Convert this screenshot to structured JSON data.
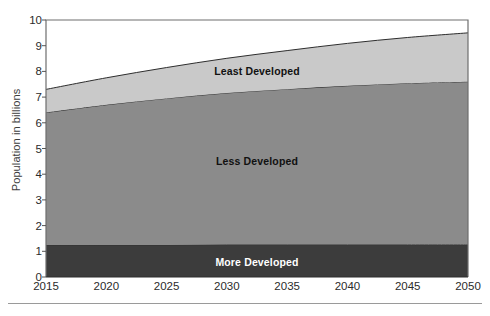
{
  "chart_data": {
    "type": "area",
    "stacked": true,
    "title": "",
    "subtitle": "",
    "xlabel": "",
    "ylabel": "Population in billions",
    "xlim": [
      2015,
      2050
    ],
    "ylim": [
      0,
      10
    ],
    "grid": false,
    "legend_position": "inline-annotations",
    "x": [
      2015,
      2020,
      2025,
      2030,
      2035,
      2040,
      2045,
      2050
    ],
    "xticklabels": [
      "2015",
      "2020",
      "2025",
      "2030",
      "2035",
      "2040",
      "2045",
      "2050"
    ],
    "yticks": [
      0,
      1,
      2,
      3,
      4,
      5,
      6,
      7,
      8,
      9,
      10
    ],
    "yticklabels": [
      "0",
      "1",
      "2",
      "3",
      "4",
      "5",
      "6",
      "7",
      "8",
      "9",
      "10"
    ],
    "series": [
      {
        "name": "More Developed",
        "color": "#3c3c3c",
        "label_color": "#ffffff",
        "values": [
          1.25,
          1.25,
          1.25,
          1.26,
          1.26,
          1.26,
          1.26,
          1.26
        ]
      },
      {
        "name": "Less Developed",
        "color": "#8b8b8b",
        "label_color": "#111111",
        "values": [
          5.15,
          5.45,
          5.7,
          5.9,
          6.05,
          6.18,
          6.28,
          6.34
        ]
      },
      {
        "name": "Least Developed",
        "color": "#c9c9c9",
        "label_color": "#111111",
        "values": [
          0.9,
          1.05,
          1.2,
          1.35,
          1.5,
          1.65,
          1.78,
          1.9
        ]
      }
    ],
    "cumulative_tops": {
      "more_developed": [
        1.25,
        1.25,
        1.25,
        1.26,
        1.26,
        1.26,
        1.26,
        1.26
      ],
      "less_developed": [
        6.4,
        6.7,
        6.95,
        7.16,
        7.31,
        7.44,
        7.54,
        7.6
      ],
      "total": [
        7.3,
        7.75,
        8.15,
        8.51,
        8.81,
        9.09,
        9.32,
        9.5
      ]
    },
    "annotations": [
      {
        "text": "Least Developed",
        "x": 2032.5,
        "y": 8.0
      },
      {
        "text": "Less Developed",
        "x": 2032.5,
        "y": 4.5
      },
      {
        "text": "More Developed",
        "x": 2032.5,
        "y": 0.6
      }
    ]
  },
  "axes": {
    "y_title": "Population in billions",
    "frame_color": "#6e6e6e",
    "tick_color": "#2b2b2b",
    "background": "#ffffff"
  },
  "figure": {
    "footer_rule_color": "#9a9a9a"
  }
}
